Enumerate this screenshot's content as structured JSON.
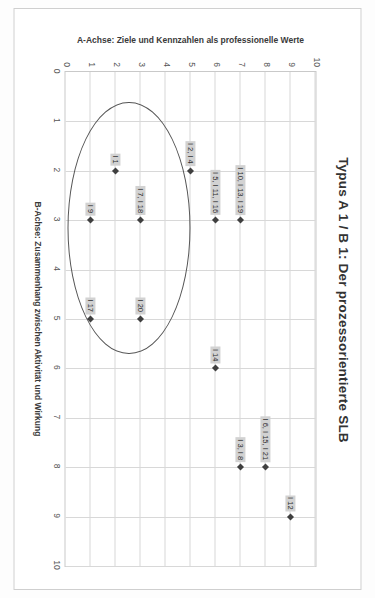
{
  "figure": {
    "title": "Typus A 1 / B 1: Der prozessorientierte SLB"
  },
  "chart_data": {
    "type": "scatter",
    "title": "Typus A 1 / B 1: Der prozessorientierte SLB",
    "xlabel": "B-Achse: Zusammenhang zwischen Aktivität und Wirkung",
    "ylabel": "A-Achse: Ziele und Kennzahlen als professionelle Werte",
    "xlim": [
      0,
      10
    ],
    "ylim": [
      0,
      10
    ],
    "xticks": [
      "0",
      "1",
      "2",
      "3",
      "4",
      "5",
      "6",
      "7",
      "8",
      "9",
      "10"
    ],
    "yticks": [
      "0",
      "1",
      "2",
      "3",
      "4",
      "5",
      "6",
      "7",
      "8",
      "9",
      "10"
    ],
    "grid": true,
    "legend": "none",
    "points": [
      {
        "label": "I 12",
        "x": 9,
        "y": 9
      },
      {
        "label": "I 6, I 15, I 21",
        "x": 8,
        "y": 8
      },
      {
        "label": "I 3, I 8",
        "x": 8,
        "y": 7
      },
      {
        "label": "I 14",
        "x": 6,
        "y": 6
      },
      {
        "label": "I 10, I 13, I 19",
        "x": 3,
        "y": 7
      },
      {
        "label": "I 5, I 11, I 16",
        "x": 3,
        "y": 6
      },
      {
        "label": "I 2, I 4",
        "x": 2,
        "y": 5
      },
      {
        "label": "I 20",
        "x": 5,
        "y": 3
      },
      {
        "label": "I 17",
        "x": 5,
        "y": 1
      },
      {
        "label": "I 7, I 18",
        "x": 3,
        "y": 3
      },
      {
        "label": "I 9",
        "x": 3,
        "y": 1
      },
      {
        "label": "I 1",
        "x": 2,
        "y": 2
      }
    ],
    "annotations": [
      {
        "type": "ellipse",
        "name": "cluster-highlight-ellipse",
        "center_x": 3.15,
        "center_y": 2.55,
        "radius_x": 2.55,
        "radius_y": 2.45
      }
    ],
    "colors": {
      "marker": "#3f3f3f",
      "label_background": "#d2d2d2",
      "grid": "#d8d8d8",
      "ellipse": "#555555",
      "frame": "#cfcfcf"
    }
  }
}
